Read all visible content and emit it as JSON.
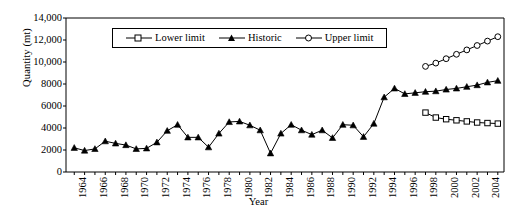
{
  "chart_data": {
    "type": "line",
    "title": "",
    "xlabel": "Year",
    "ylabel": "Quantity (mt)",
    "xlim": [
      1963.2,
      2005.6
    ],
    "ylim": [
      0,
      14000
    ],
    "grid": false,
    "legend_position": "top-center",
    "ytick_labels": [
      "0",
      "2000",
      "4000",
      "6000",
      "8000",
      "10,000",
      "12,000",
      "14,000"
    ],
    "ytick_values": [
      0,
      2000,
      4000,
      6000,
      8000,
      10000,
      12000,
      14000
    ],
    "xtick_labels": [
      "1964",
      "1966",
      "1968",
      "1970",
      "1972",
      "1974",
      "1976",
      "1978",
      "1980",
      "1982",
      "1984",
      "1986",
      "1988",
      "1990",
      "1992",
      "1994",
      "1996",
      "1998",
      "2000",
      "2002",
      "2004"
    ],
    "xtick_values": [
      1964,
      1966,
      1968,
      1970,
      1972,
      1974,
      1976,
      1978,
      1980,
      1982,
      1984,
      1986,
      1988,
      1990,
      1992,
      1994,
      1996,
      1998,
      2000,
      2002,
      2004
    ],
    "series": [
      {
        "name": "Lower limit",
        "marker": "open-square",
        "x": [
          1998,
          1999,
          2000,
          2001,
          2002,
          2003,
          2004,
          2005
        ],
        "values": [
          5400,
          4950,
          4800,
          4700,
          4600,
          4500,
          4450,
          4400
        ]
      },
      {
        "name": "Historic",
        "marker": "filled-triangle",
        "x": [
          1964,
          1965,
          1966,
          1967,
          1968,
          1969,
          1970,
          1971,
          1972,
          1973,
          1974,
          1975,
          1976,
          1977,
          1978,
          1979,
          1980,
          1981,
          1982,
          1983,
          1984,
          1985,
          1986,
          1987,
          1988,
          1989,
          1990,
          1991,
          1992,
          1993,
          1994,
          1995,
          1996,
          1997,
          1998,
          1999,
          2000,
          2001,
          2002,
          2003,
          2004,
          2005
        ],
        "values": [
          2200,
          1950,
          2100,
          2800,
          2600,
          2450,
          2100,
          2150,
          2700,
          3750,
          4300,
          3150,
          3150,
          2250,
          3500,
          4550,
          4600,
          4250,
          3800,
          1700,
          3500,
          4300,
          3800,
          3400,
          3800,
          3100,
          4300,
          4250,
          3200,
          4400,
          6800,
          7600,
          7100,
          7200,
          7300,
          7350,
          7500,
          7600,
          7750,
          7900,
          8150,
          8300
        ]
      },
      {
        "name": "Upper limit",
        "marker": "open-circle",
        "x": [
          1998,
          1999,
          2000,
          2001,
          2002,
          2003,
          2004,
          2005
        ],
        "values": [
          9600,
          9900,
          10300,
          10700,
          11100,
          11500,
          11900,
          12300
        ]
      }
    ]
  },
  "legend": {
    "items": [
      {
        "label": "Lower limit"
      },
      {
        "label": "Historic"
      },
      {
        "label": "Upper limit"
      }
    ]
  }
}
